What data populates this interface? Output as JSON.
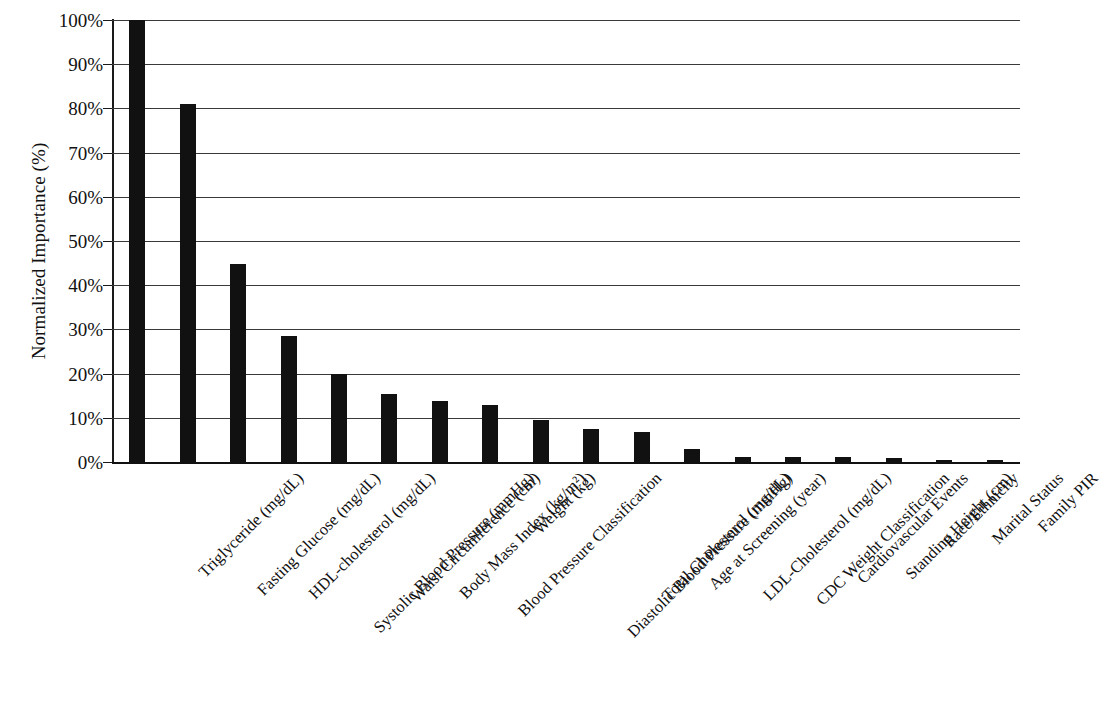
{
  "chart_data": {
    "type": "bar",
    "title": "",
    "xlabel": "",
    "ylabel": "Normalized Importance (%)",
    "ylim": [
      0,
      100
    ],
    "ytick_labels": [
      "100%",
      "90%",
      "80%",
      "70%",
      "60%",
      "50%",
      "40%",
      "30%",
      "20%",
      "10%",
      "0%"
    ],
    "ytick_values": [
      100,
      90,
      80,
      70,
      60,
      50,
      40,
      30,
      20,
      10,
      0
    ],
    "grid": "horizontal",
    "legend": "none",
    "bar_color": "#111111",
    "categories": [
      "Triglyceride (mg/dL)",
      "Fasting Glucose (mg/dL)",
      "HDL-cholesterol (mg/dL)",
      "Systolic Blood Pressure (mmHg)",
      "Waist Circumference (cm)",
      "Body Mass Index (kg/m²)",
      "Blood Pressure Classification",
      "Weight (kg)",
      "Diastolic Blood Pressure (mmHg)",
      "Total Cholesterol (mg/dL)",
      "Age at Screening (year)",
      "LDL-Cholesterol (mg/dL)",
      "CDC Weight Classification",
      "Cardiovascular Events",
      "Standing Height (cm)",
      "Race/Ethnicity",
      "Marital Status",
      "Family PIR"
    ],
    "values": [
      100,
      81,
      44.8,
      28.6,
      20,
      15.4,
      13.7,
      12.8,
      9.4,
      7.4,
      6.7,
      2.9,
      1.2,
      1.2,
      1.2,
      0.8,
      0.4,
      0.3
    ]
  }
}
